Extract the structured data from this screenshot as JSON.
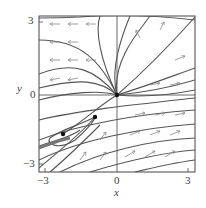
{
  "axes": {
    "x_label": "x",
    "y_label": "y",
    "x_ticks": [
      "−3",
      "0",
      "3"
    ],
    "y_ticks": [
      "3",
      "0",
      "−3"
    ],
    "xlim": [
      -3.25,
      3.25
    ],
    "ylim": [
      -3.25,
      3.25
    ]
  },
  "equilibria": [
    {
      "x": 0,
      "y": 0
    },
    {
      "x": -0.9,
      "y": -0.9
    },
    {
      "x": -2.25,
      "y": -1.6
    }
  ],
  "colors": {
    "curve": "#555555",
    "arrow": "#888888",
    "frame": "#444444",
    "dot": "#111111"
  }
}
